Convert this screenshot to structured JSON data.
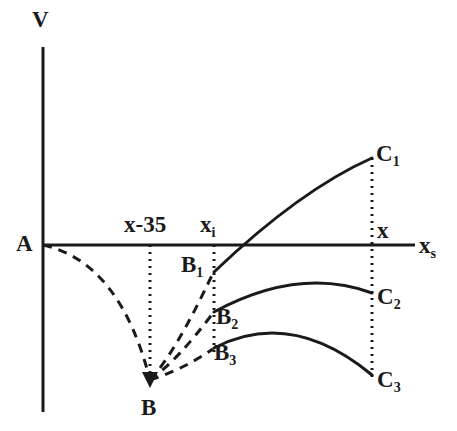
{
  "figure": {
    "type": "line-diagram",
    "background_color": "#ffffff",
    "stroke_color": "#1a1a1a",
    "axes": {
      "vertical_label": "V",
      "horizontal_label": "x",
      "horizontal_label_sub": "s",
      "origin_label": "A",
      "vertical_axis": {
        "x": 43,
        "y_top": 47,
        "y_bottom": 412
      },
      "horizontal_axis": {
        "y": 245,
        "x_left": 43,
        "x_right": 415
      }
    },
    "tick_labels": [
      {
        "name": "x-minus-35",
        "text": "x-35",
        "sub": "",
        "x": 124,
        "y": 213
      },
      {
        "name": "x-i",
        "text": "x",
        "sub": "i",
        "x": 200,
        "y": 213
      },
      {
        "name": "x",
        "text": "x",
        "sub": "",
        "x": 377,
        "y": 219
      }
    ],
    "points": [
      {
        "name": "A",
        "label": "A",
        "sub": "",
        "px": 43,
        "py": 245,
        "label_x": 16,
        "label_y": 232
      },
      {
        "name": "B",
        "label": "B",
        "sub": "",
        "px": 150,
        "py": 382,
        "label_x": 141,
        "label_y": 396
      },
      {
        "name": "B1",
        "label": "B",
        "sub": "1",
        "px": 214,
        "py": 272,
        "label_x": 181,
        "label_y": 253
      },
      {
        "name": "B2",
        "label": "B",
        "sub": "2",
        "px": 214,
        "py": 312,
        "label_x": 216,
        "label_y": 305
      },
      {
        "name": "B3",
        "label": "B",
        "sub": "3",
        "px": 214,
        "py": 348,
        "label_x": 214,
        "label_y": 341
      },
      {
        "name": "C1",
        "label": "C",
        "sub": "1",
        "px": 372,
        "py": 158,
        "label_x": 376,
        "label_y": 142
      },
      {
        "name": "C2",
        "label": "C",
        "sub": "2",
        "px": 372,
        "py": 293,
        "label_x": 377,
        "label_y": 285
      },
      {
        "name": "C3",
        "label": "C",
        "sub": "3",
        "px": 372,
        "py": 375,
        "label_x": 377,
        "label_y": 368
      }
    ],
    "dotted_verticals": [
      {
        "name": "dotted-x-minus-35",
        "x": 150,
        "y_top": 245,
        "y_bottom": 380
      },
      {
        "name": "dotted-x-i",
        "x": 214,
        "y_top": 245,
        "y_bottom": 352
      },
      {
        "name": "dotted-x",
        "x": 372,
        "y_top": 158,
        "y_bottom": 377
      }
    ],
    "dashed_curves": [
      {
        "name": "curve-A-to-B",
        "from": "A",
        "to": "B",
        "path": "M 43 245 Q 120 262 150 380"
      },
      {
        "name": "curve-B-to-B1",
        "from": "B",
        "to": "B1",
        "path": "M 150 380 Q 176 352 213 273"
      },
      {
        "name": "curve-B-to-B2",
        "from": "B",
        "to": "B2",
        "path": "M 150 380 Q 178 360 213 313"
      },
      {
        "name": "curve-B-to-B3",
        "from": "B",
        "to": "B3",
        "path": "M 150 380 Q 182 370 213 349"
      }
    ],
    "solid_curves": [
      {
        "name": "curve-B1-to-C1",
        "from": "B1",
        "to": "C1",
        "path": "M 214 272 Q 300 190 372 158",
        "axis_crossing_x": 238
      },
      {
        "name": "curve-B2-to-C2",
        "from": "B2",
        "to": "C2",
        "path": "M 214 312 Q 299 266 372 293",
        "peak": {
          "x": 300,
          "y": 278
        }
      },
      {
        "name": "curve-B3-to-C3",
        "from": "B3",
        "to": "C3",
        "path": "M 214 348 Q 291 308 372 375",
        "peak": {
          "x": 290,
          "y": 322
        }
      }
    ]
  }
}
